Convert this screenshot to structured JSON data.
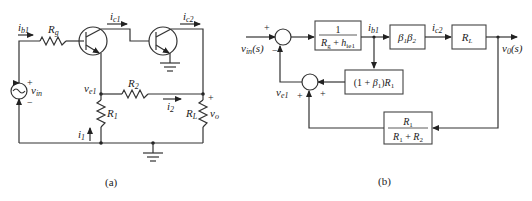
{
  "figure_a": {
    "caption": "(a)",
    "labels": {
      "ib1": "i",
      "ib1_sub": "b1",
      "rg": "R",
      "rg_sub": "g",
      "ic1": "i",
      "ic1_sub": "c1",
      "ic2": "i",
      "ic2_sub": "c2",
      "vin": "v",
      "vin_sub": "in",
      "plus": "+",
      "minus": "−",
      "ve1": "v",
      "ve1_sub": "e1",
      "r2": "R",
      "r2_sub": "2",
      "r1": "R",
      "r1_sub": "1",
      "i1": "i",
      "i1_sub": "1",
      "i2": "i",
      "i2_sub": "2",
      "rl": "R",
      "rl_sub": "L",
      "vo": "v",
      "vo_sub": "o",
      "vo_plus": "+"
    }
  },
  "figure_b": {
    "caption": "(b)",
    "input": "v",
    "input_sub": "in",
    "input_arg": "(s)",
    "output": "v",
    "output_sub": "0",
    "output_arg": "(s)",
    "sum1_plus": "+",
    "sum1_minus": "−",
    "sum2_plus_left": "+",
    "sum2_plus_right": "+",
    "ve1": "v",
    "ve1_sub": "e1",
    "ib1": "i",
    "ib1_sub": "b1",
    "ic2": "i",
    "ic2_sub": "c2",
    "blocks": {
      "forward1": {
        "num": "1",
        "den_a": "R",
        "den_a_sub": "g",
        "den_op": " + ",
        "den_b": "h",
        "den_b_sub": "ie1"
      },
      "gain": {
        "a": "β",
        "a_sub": "1",
        "b": "β",
        "b_sub": "2"
      },
      "load": {
        "a": "R",
        "a_sub": "L"
      },
      "emitter_fb": {
        "pre": "(1 + ",
        "b": "β",
        "b_sub": "1",
        "post": ")",
        "r": "R",
        "r_sub": "1"
      },
      "divider": {
        "num": "R",
        "num_sub": "1",
        "den_a": "R",
        "den_a_sub": "1",
        "den_op": " + ",
        "den_b": "R",
        "den_b_sub": "2"
      }
    }
  }
}
